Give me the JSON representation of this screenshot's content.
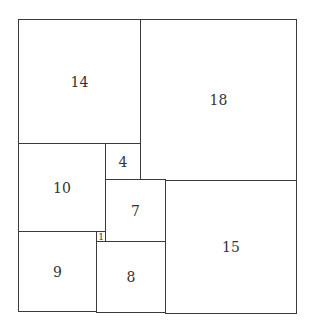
{
  "diagram": {
    "type": "squared-rectangle-dissection",
    "line_color": "#3a3a3a",
    "background": "#ffffff",
    "squares": [
      {
        "label": "14",
        "x": 18,
        "y": 19,
        "w": 122,
        "h": 124
      },
      {
        "label": "18",
        "x": 140,
        "y": 19,
        "w": 156,
        "h": 161
      },
      {
        "label": "10",
        "x": 18,
        "y": 143,
        "w": 87,
        "h": 88
      },
      {
        "label": "4",
        "x": 105,
        "y": 143,
        "w": 35,
        "h": 36
      },
      {
        "label": "7",
        "x": 105,
        "y": 179,
        "w": 60,
        "h": 62
      },
      {
        "label": "15",
        "x": 165,
        "y": 180,
        "w": 131,
        "h": 133
      },
      {
        "label": "1",
        "x": 96,
        "y": 231,
        "w": 9,
        "h": 10
      },
      {
        "label": "9",
        "x": 18,
        "y": 231,
        "w": 78,
        "h": 80
      },
      {
        "label": "8",
        "x": 96,
        "y": 241,
        "w": 69,
        "h": 71
      }
    ]
  }
}
